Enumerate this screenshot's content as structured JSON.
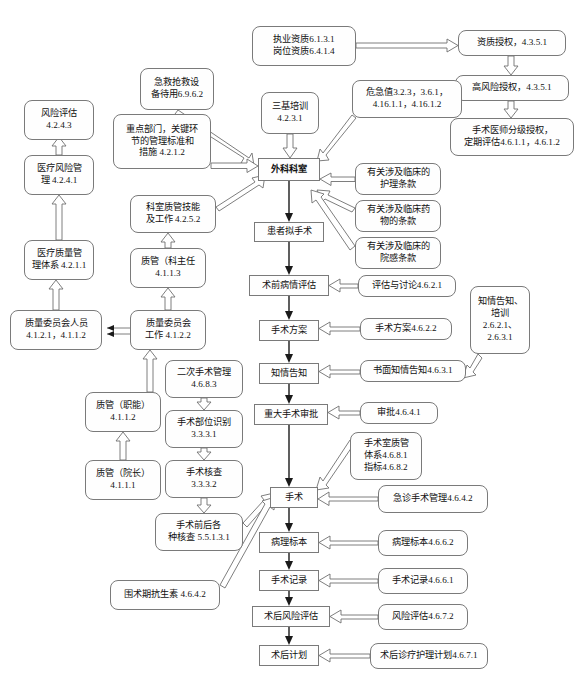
{
  "diagram": {
    "nodes": [
      {
        "id": "n_zhiye",
        "text": "执业资质6.1.3.1\n岗位资质6.4.1.4",
        "x": 252,
        "y": 26,
        "w": 104,
        "h": 40,
        "shape": "rounded"
      },
      {
        "id": "n_zizhi",
        "text": "资质授权，4.3.5.1",
        "x": 458,
        "y": 30,
        "w": 108,
        "h": 26,
        "shape": "rounded"
      },
      {
        "id": "n_gaofeng",
        "text": "高风险授权，4.3.5.1",
        "x": 455,
        "y": 75,
        "w": 114,
        "h": 26,
        "shape": "rounded"
      },
      {
        "id": "n_fenji",
        "text": "手术医师分级授权，\n定期评估4.6.1.1，4.6.1.2",
        "x": 450,
        "y": 118,
        "w": 124,
        "h": 38,
        "shape": "rounded"
      },
      {
        "id": "n_jijiu",
        "text": "急救抢救设\n备待用6.9.6.2",
        "x": 140,
        "y": 68,
        "w": 74,
        "h": 42,
        "shape": "rounded"
      },
      {
        "id": "n_weiji",
        "text": "危急值3.2.3，3.6.1，\n4.16.1.1，4.16.1.2",
        "x": 352,
        "y": 80,
        "w": 110,
        "h": 38,
        "shape": "rounded"
      },
      {
        "id": "n_sanji",
        "text": "三基培训\n4.2.3.1",
        "x": 261,
        "y": 92,
        "w": 58,
        "h": 42,
        "shape": "rounded"
      },
      {
        "id": "n_zhongdian",
        "text": "重点部门，关键环\n节的管理标准和\n措施 4.2.1.2",
        "x": 113,
        "y": 114,
        "w": 98,
        "h": 55,
        "shape": "rounded"
      },
      {
        "id": "n_fengxian",
        "text": "风险评估\n4.2.4.3",
        "x": 24,
        "y": 100,
        "w": 70,
        "h": 40,
        "shape": "rounded"
      },
      {
        "id": "n_waike",
        "text": "外科科室",
        "x": 258,
        "y": 158,
        "w": 62,
        "h": 23,
        "shape": "sharp",
        "bold": true
      },
      {
        "id": "n_hulitiaokuan",
        "text": "有关涉及临床的\n护理条款",
        "x": 355,
        "y": 163,
        "w": 86,
        "h": 32,
        "shape": "rounded"
      },
      {
        "id": "n_yaowutiaokuan",
        "text": "有关涉及临床药\n物的条款",
        "x": 355,
        "y": 200,
        "w": 86,
        "h": 32,
        "shape": "rounded"
      },
      {
        "id": "n_yuangantiaokuan",
        "text": "有关涉及临床的\n院感条款",
        "x": 355,
        "y": 237,
        "w": 86,
        "h": 32,
        "shape": "rounded"
      },
      {
        "id": "n_yiliaofengxian",
        "text": "医疗风险管\n理 4.2.4.1",
        "x": 24,
        "y": 155,
        "w": 70,
        "h": 40,
        "shape": "rounded"
      },
      {
        "id": "n_keshizhiguan",
        "text": "科室质管技能\n及工作 4.2.5.2",
        "x": 130,
        "y": 195,
        "w": 86,
        "h": 38,
        "shape": "rounded"
      },
      {
        "id": "n_huanzhe",
        "text": "患者拟手术",
        "x": 254,
        "y": 222,
        "w": 70,
        "h": 20,
        "shape": "sharp"
      },
      {
        "id": "n_zhilianti",
        "text": "医疗质量管\n理体系 4.2.1.1",
        "x": 24,
        "y": 240,
        "w": 70,
        "h": 40,
        "shape": "rounded"
      },
      {
        "id": "n_zhiguanke",
        "text": "质管（科主任\n4.1.1.3",
        "x": 130,
        "y": 248,
        "w": 76,
        "h": 40,
        "shape": "rounded"
      },
      {
        "id": "n_shuqian",
        "text": "术前病情评估",
        "x": 249,
        "y": 275,
        "w": 80,
        "h": 21,
        "shape": "sharp"
      },
      {
        "id": "n_pinggutaolun",
        "text": "评估与讨论4.6.2.1",
        "x": 358,
        "y": 275,
        "w": 98,
        "h": 22,
        "shape": "rounded"
      },
      {
        "id": "n_zhiqinggaozhi_peixun",
        "text": "知情告知、\n培训\n2.6.2.1、\n2.6.3.1",
        "x": 470,
        "y": 286,
        "w": 60,
        "h": 68,
        "shape": "rounded"
      },
      {
        "id": "n_zhiliangweiyuanren",
        "text": "质量委员会人员\n4.1.2.1，4.1.1.2",
        "x": 10,
        "y": 310,
        "w": 92,
        "h": 40,
        "shape": "rounded"
      },
      {
        "id": "n_zhiliangweiyuangongzuo",
        "text": "质量委员会\n工作 4.1.2.2",
        "x": 130,
        "y": 310,
        "w": 76,
        "h": 40,
        "shape": "rounded"
      },
      {
        "id": "n_shoushufangan",
        "text": "手术方案",
        "x": 259,
        "y": 320,
        "w": 60,
        "h": 21,
        "shape": "sharp"
      },
      {
        "id": "n_shoushufangan_r",
        "text": "手术方案4.6.2.2",
        "x": 360,
        "y": 318,
        "w": 92,
        "h": 22,
        "shape": "rounded"
      },
      {
        "id": "n_erci",
        "text": "二次手术管理\n4.6.8.3",
        "x": 165,
        "y": 360,
        "w": 78,
        "h": 38,
        "shape": "rounded"
      },
      {
        "id": "n_zhiqinggaozhi",
        "text": "知情告知",
        "x": 259,
        "y": 363,
        "w": 60,
        "h": 21,
        "shape": "sharp"
      },
      {
        "id": "n_shumianzhiqing",
        "text": "书面知情告知4.6.3.1",
        "x": 360,
        "y": 360,
        "w": 106,
        "h": 22,
        "shape": "rounded"
      },
      {
        "id": "n_zhiguanzhineng",
        "text": "质管（职能）\n4.1.1.2",
        "x": 85,
        "y": 392,
        "w": 76,
        "h": 40,
        "shape": "rounded"
      },
      {
        "id": "n_shoushubuwei",
        "text": "手术部位识别\n3.3.3.1",
        "x": 165,
        "y": 410,
        "w": 78,
        "h": 38,
        "shape": "rounded"
      },
      {
        "id": "n_zhongdashoushu",
        "text": "重大手术审批",
        "x": 254,
        "y": 404,
        "w": 74,
        "h": 21,
        "shape": "sharp"
      },
      {
        "id": "n_shenpi",
        "text": "审批4.6.4.1",
        "x": 360,
        "y": 402,
        "w": 78,
        "h": 22,
        "shape": "rounded"
      },
      {
        "id": "n_shoushushizhiguan",
        "text": "手术室质管\n体系4.6.8.1\n指标4.6.8.2",
        "x": 350,
        "y": 432,
        "w": 72,
        "h": 48,
        "shape": "rounded"
      },
      {
        "id": "n_zhiguanyuanzhang",
        "text": "质管（院长）\n4.1.1.1",
        "x": 85,
        "y": 460,
        "w": 76,
        "h": 40,
        "shape": "rounded"
      },
      {
        "id": "n_shoushuhecha",
        "text": "手术核查\n3.3.3.2",
        "x": 165,
        "y": 460,
        "w": 78,
        "h": 38,
        "shape": "rounded"
      },
      {
        "id": "n_shoushu",
        "text": "手术",
        "x": 270,
        "y": 487,
        "w": 48,
        "h": 21,
        "shape": "sharp"
      },
      {
        "id": "n_jizhen",
        "text": "急诊手术管理4.6.4.2",
        "x": 378,
        "y": 485,
        "w": 110,
        "h": 28,
        "shape": "rounded"
      },
      {
        "id": "n_shoushuqianhou",
        "text": "手术前后各\n种核查 5.5.1.3.1",
        "x": 155,
        "y": 513,
        "w": 88,
        "h": 38,
        "shape": "rounded"
      },
      {
        "id": "n_bingli",
        "text": "病理标本",
        "x": 259,
        "y": 532,
        "w": 60,
        "h": 21,
        "shape": "sharp"
      },
      {
        "id": "n_bingli_r",
        "text": "病理标本4.6.6.2",
        "x": 378,
        "y": 530,
        "w": 90,
        "h": 26,
        "shape": "rounded"
      },
      {
        "id": "n_weishusu",
        "text": "围术期抗生素 4.6.4.2",
        "x": 110,
        "y": 580,
        "w": 110,
        "h": 30,
        "shape": "rounded"
      },
      {
        "id": "n_shoushujilu",
        "text": "手术记录",
        "x": 259,
        "y": 570,
        "w": 60,
        "h": 21,
        "shape": "sharp"
      },
      {
        "id": "n_shoushujilu_r",
        "text": "手术记录4.6.6.1",
        "x": 378,
        "y": 568,
        "w": 90,
        "h": 26,
        "shape": "rounded"
      },
      {
        "id": "n_shuhoufengxian",
        "text": "术后风险评估",
        "x": 252,
        "y": 606,
        "w": 78,
        "h": 21,
        "shape": "sharp"
      },
      {
        "id": "n_fengxianpinggu_r",
        "text": "风险评估4.6.7.2",
        "x": 378,
        "y": 604,
        "w": 90,
        "h": 26,
        "shape": "rounded"
      },
      {
        "id": "n_shuhoujihua",
        "text": "术后计划",
        "x": 259,
        "y": 645,
        "w": 60,
        "h": 21,
        "shape": "sharp"
      },
      {
        "id": "n_shuhouzhenliao",
        "text": "术后诊疗护理计划4.6.7.1",
        "x": 370,
        "y": 643,
        "w": 118,
        "h": 26,
        "shape": "rounded"
      }
    ],
    "edges": [
      {
        "from": "n_zhiye",
        "to": "n_zizhi",
        "style": "hollow"
      },
      {
        "from": "n_zizhi",
        "to": "n_gaofeng",
        "style": "hollow"
      },
      {
        "from": "n_gaofeng",
        "to": "n_fenji",
        "style": "hollow"
      },
      {
        "from": "n_jijiu",
        "to": "n_waike",
        "style": "hollow"
      },
      {
        "from": "n_zhongdian",
        "to": "n_waike",
        "style": "hollow"
      },
      {
        "from": "n_sanji",
        "to": "n_waike",
        "style": "hollow"
      },
      {
        "from": "n_weiji",
        "to": "n_waike",
        "style": "hollow"
      },
      {
        "from": "n_hulitiaokuan",
        "to": "n_waike",
        "style": "hollow"
      },
      {
        "from": "n_yaowutiaokuan",
        "to": "n_waike",
        "style": "hollow"
      },
      {
        "from": "n_yuangantiaokuan",
        "to": "n_waike",
        "style": "hollow"
      },
      {
        "from": "n_keshizhiguan",
        "to": "n_waike",
        "style": "hollow"
      },
      {
        "from": "n_yiliaofengxian",
        "to": "n_fengxian",
        "style": "hollow"
      },
      {
        "from": "n_zhilianti",
        "to": "n_yiliaofengxian",
        "style": "hollow"
      },
      {
        "from": "n_zhiliangweiyuanren",
        "to": "n_zhilianti",
        "style": "hollow"
      },
      {
        "from": "n_zhiguanke",
        "to": "n_keshizhiguan",
        "style": "hollow"
      },
      {
        "from": "n_zhiliangweiyuangongzuo",
        "to": "n_zhiguanke",
        "style": "hollow"
      },
      {
        "from": "n_zhiliangweiyuangongzuo",
        "to": "n_zhiliangweiyuanren",
        "style": "solid"
      },
      {
        "from": "n_zhiguanzhineng",
        "to": "n_zhiliangweiyuangongzuo",
        "style": "hollow"
      },
      {
        "from": "n_zhiguanyuanzhang",
        "to": "n_zhiguanzhineng",
        "style": "hollow"
      },
      {
        "from": "n_erci",
        "to": "n_shoushubuwei",
        "style": "hollow"
      },
      {
        "from": "n_shoushubuwei",
        "to": "n_shoushuhecha",
        "style": "hollow"
      },
      {
        "from": "n_shoushuhecha",
        "to": "n_shoushuqianhou",
        "style": "hollow"
      },
      {
        "from": "n_shoushuqianhou",
        "to": "n_shoushu",
        "style": "hollow"
      },
      {
        "from": "n_weishusu",
        "to": "n_shoushu",
        "style": "hollow"
      },
      {
        "from": "n_waike",
        "to": "n_huanzhe",
        "style": "solid"
      },
      {
        "from": "n_huanzhe",
        "to": "n_shuqian",
        "style": "solid"
      },
      {
        "from": "n_pinggutaolun",
        "to": "n_shuqian",
        "style": "hollow"
      },
      {
        "from": "n_shuqian",
        "to": "n_shoushufangan",
        "style": "solid"
      },
      {
        "from": "n_shoushufangan_r",
        "to": "n_shoushufangan",
        "style": "hollow"
      },
      {
        "from": "n_shoushufangan",
        "to": "n_zhiqinggaozhi",
        "style": "solid"
      },
      {
        "from": "n_shumianzhiqing",
        "to": "n_zhiqinggaozhi",
        "style": "hollow"
      },
      {
        "from": "n_zhiqinggaozhi_peixun",
        "to": "n_shumianzhiqing",
        "style": "hollow"
      },
      {
        "from": "n_zhiqinggaozhi",
        "to": "n_zhongdashoushu",
        "style": "solid"
      },
      {
        "from": "n_shenpi",
        "to": "n_zhongdashoushu",
        "style": "hollow"
      },
      {
        "from": "n_zhongdashoushu",
        "to": "n_shoushu",
        "style": "solid"
      },
      {
        "from": "n_shoushushizhiguan",
        "to": "n_shoushu",
        "style": "hollow"
      },
      {
        "from": "n_jizhen",
        "to": "n_shoushu",
        "style": "hollow"
      },
      {
        "from": "n_shoushu",
        "to": "n_bingli",
        "style": "solid"
      },
      {
        "from": "n_bingli_r",
        "to": "n_bingli",
        "style": "hollow"
      },
      {
        "from": "n_bingli",
        "to": "n_shoushujilu",
        "style": "solid"
      },
      {
        "from": "n_shoushujilu_r",
        "to": "n_shoushujilu",
        "style": "hollow"
      },
      {
        "from": "n_shoushujilu",
        "to": "n_shuhoufengxian",
        "style": "solid"
      },
      {
        "from": "n_fengxianpinggu_r",
        "to": "n_shuhoufengxian",
        "style": "hollow"
      },
      {
        "from": "n_shuhoufengxian",
        "to": "n_shuhoujihua",
        "style": "solid"
      },
      {
        "from": "n_shuhouzhenliao",
        "to": "n_shuhoujihua",
        "style": "hollow"
      }
    ]
  }
}
